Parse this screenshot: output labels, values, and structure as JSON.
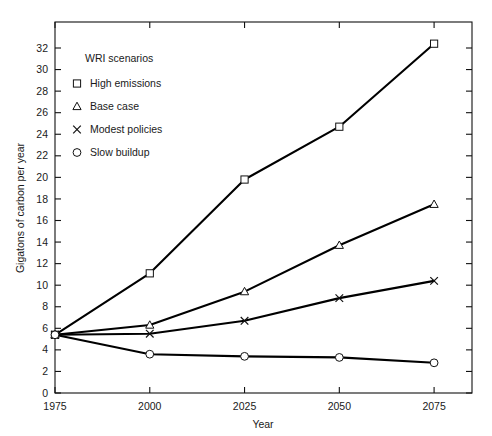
{
  "chart_data": {
    "type": "line",
    "title": "",
    "xlabel": "Year",
    "ylabel": "Gigatons of carbon per year",
    "x": [
      1975,
      2000,
      2025,
      2050,
      2075
    ],
    "xticklabels": [
      "1975",
      "2000",
      "2025",
      "2050",
      "2075"
    ],
    "yticklabels": [
      "0",
      "2",
      "4",
      "6",
      "8",
      "10",
      "12",
      "14",
      "16",
      "18",
      "20",
      "22",
      "24",
      "26",
      "28",
      "30",
      "32"
    ],
    "yticks": [
      0,
      2,
      4,
      6,
      8,
      10,
      12,
      14,
      16,
      18,
      20,
      22,
      24,
      26,
      28,
      30,
      32
    ],
    "xlim": [
      1975,
      2085
    ],
    "ylim": [
      0,
      33
    ],
    "grid": false,
    "legend_position": "upper-left-inside",
    "legend_title": "WRI scenarios",
    "series": [
      {
        "name": "High emissions",
        "marker": "square",
        "values": [
          5.4,
          11.1,
          19.8,
          24.7,
          32.4
        ]
      },
      {
        "name": "Base case",
        "marker": "triangle",
        "values": [
          5.4,
          6.3,
          9.4,
          13.7,
          17.5
        ]
      },
      {
        "name": "Modest policies",
        "marker": "x",
        "values": [
          5.4,
          5.5,
          6.7,
          8.8,
          10.4
        ]
      },
      {
        "name": "Slow buildup",
        "marker": "circle",
        "values": [
          5.4,
          3.6,
          3.4,
          3.3,
          2.8
        ]
      }
    ]
  },
  "colors": {
    "line": "#000000",
    "axis": "#111111",
    "background": "#ffffff",
    "marker_fill": "#ffffff"
  }
}
